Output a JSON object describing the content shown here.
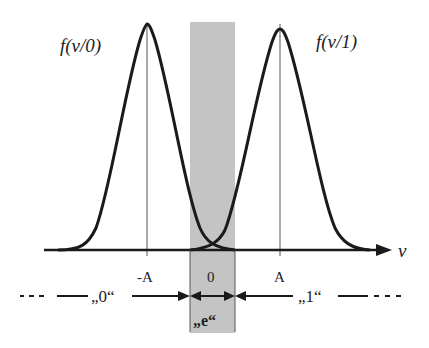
{
  "diagram": {
    "type": "decision-regions-two-gaussians",
    "curve_left_label": "f(ν/0)",
    "curve_right_label": "f(ν/1)",
    "axis_label": "ν",
    "ticks": [
      {
        "label": "-A",
        "x": 148
      },
      {
        "label": "0",
        "x": 212
      },
      {
        "label": "A",
        "x": 280
      }
    ],
    "regions": {
      "left": "„0“",
      "erasure": "„e“",
      "right": "„1“"
    },
    "colors": {
      "curve": "#1a1a1a",
      "axis": "#1a1a1a",
      "erasure_band": "#c4c4c4",
      "guide_line": "#555555"
    }
  }
}
